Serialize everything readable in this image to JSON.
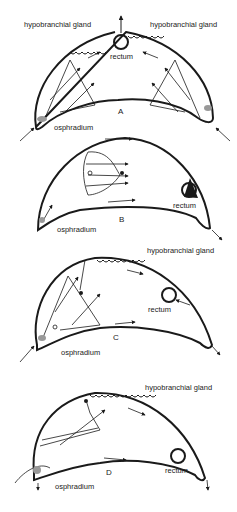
{
  "figure": {
    "panels": [
      {
        "id": "A",
        "label": "A",
        "labels": {
          "gland_left": "hypobranchial gland",
          "gland_right": "hypobranchial gland",
          "rectum": "rectum",
          "osphradium": "osphradium"
        }
      },
      {
        "id": "B",
        "label": "B",
        "labels": {
          "rectum": "rectum",
          "osphradium": "osphradium"
        }
      },
      {
        "id": "C",
        "label": "C",
        "labels": {
          "gland": "hypobranchial gland",
          "rectum": "rectum",
          "osphradium": "osphradium"
        }
      },
      {
        "id": "D",
        "label": "D",
        "labels": {
          "gland": "hypobranchial gland",
          "rectum": "rectum",
          "osphradium": "osphradium"
        }
      }
    ],
    "colors": {
      "ink": "#1a1a1a",
      "background": "#ffffff"
    }
  }
}
